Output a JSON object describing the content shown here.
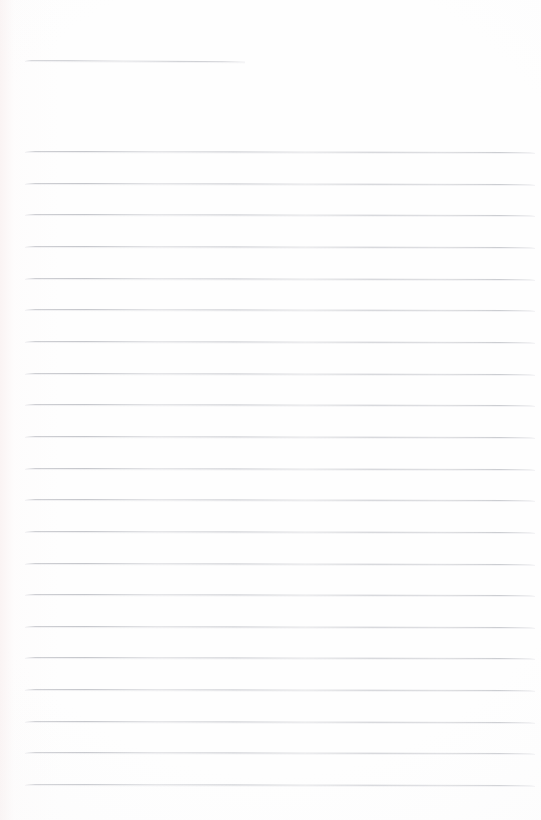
{
  "document": {
    "kind": "lined-notepaper-scan",
    "title": "Blank Ruled Notepaper",
    "page_width": 541,
    "page_height": 820,
    "content_text": "",
    "is_blank": "true"
  },
  "colors": {
    "paper_background": "#fefefe",
    "paper_edge_tint": "#faf3f3",
    "rule_ink": "#c6c7cc",
    "rule_halo": "#e9eaed"
  },
  "ruling": {
    "left_margin_x": 25,
    "right_margin_x": 535,
    "line_spacing": 31.65,
    "line_thickness": 1,
    "scan_slant_deg": 0.12
  },
  "header_rule": {
    "label": "header-rule",
    "x": 25,
    "y": 60,
    "width": 220,
    "slant_deg": 0.35
  },
  "body_rules": [
    {
      "index": 1,
      "y": 151.0,
      "x": 25,
      "width": 510
    },
    {
      "index": 2,
      "y": 182.7,
      "x": 25,
      "width": 510
    },
    {
      "index": 3,
      "y": 214.3,
      "x": 25,
      "width": 510
    },
    {
      "index": 4,
      "y": 246.0,
      "x": 25,
      "width": 510
    },
    {
      "index": 5,
      "y": 277.6,
      "x": 25,
      "width": 510
    },
    {
      "index": 6,
      "y": 309.3,
      "x": 25,
      "width": 510
    },
    {
      "index": 7,
      "y": 340.9,
      "x": 25,
      "width": 510
    },
    {
      "index": 8,
      "y": 372.6,
      "x": 25,
      "width": 510
    },
    {
      "index": 9,
      "y": 404.2,
      "x": 25,
      "width": 510
    },
    {
      "index": 10,
      "y": 435.9,
      "x": 25,
      "width": 510
    },
    {
      "index": 11,
      "y": 467.5,
      "x": 25,
      "width": 510
    },
    {
      "index": 12,
      "y": 499.2,
      "x": 25,
      "width": 510
    },
    {
      "index": 13,
      "y": 530.8,
      "x": 25,
      "width": 510
    },
    {
      "index": 14,
      "y": 562.5,
      "x": 25,
      "width": 510
    },
    {
      "index": 15,
      "y": 594.1,
      "x": 25,
      "width": 510
    },
    {
      "index": 16,
      "y": 625.8,
      "x": 25,
      "width": 510
    },
    {
      "index": 17,
      "y": 657.4,
      "x": 25,
      "width": 510
    },
    {
      "index": 18,
      "y": 689.1,
      "x": 25,
      "width": 510
    },
    {
      "index": 19,
      "y": 720.7,
      "x": 25,
      "width": 510
    },
    {
      "index": 20,
      "y": 752.4,
      "x": 25,
      "width": 510
    },
    {
      "index": 21,
      "y": 784.0,
      "x": 25,
      "width": 510
    }
  ]
}
